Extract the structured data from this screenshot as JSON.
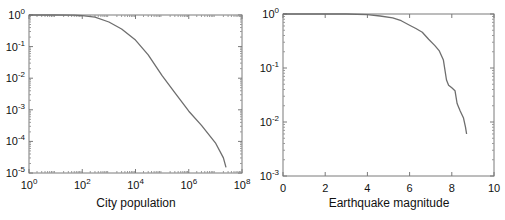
{
  "chart_data": [
    {
      "type": "line",
      "title": "",
      "xlabel": "City population",
      "ylabel": "",
      "xscale": "log",
      "yscale": "log",
      "xlim": [
        1,
        100000000
      ],
      "ylim": [
        1e-05,
        1
      ],
      "xticks": [
        "10^0",
        "10^2",
        "10^4",
        "10^6",
        "10^8"
      ],
      "yticks": [
        "10^0",
        "10^-1",
        "10^-2",
        "10^-3",
        "10^-4",
        "10^-5"
      ],
      "grid": false,
      "legend": null,
      "line_color": "#6e6e6e",
      "x": [
        1,
        10,
        50,
        100,
        300,
        1000,
        3000,
        10000,
        30000,
        100000,
        300000,
        1000000,
        3000000,
        10000000,
        20000000,
        25000000
      ],
      "y": [
        1.0,
        1.0,
        0.99,
        0.96,
        0.85,
        0.6,
        0.36,
        0.16,
        0.055,
        0.012,
        0.0035,
        0.0009,
        0.00032,
        9e-05,
        3e-05,
        1.5e-05
      ]
    },
    {
      "type": "line",
      "title": "",
      "xlabel": "Earthquake magnitude",
      "ylabel": "",
      "xscale": "linear",
      "yscale": "log",
      "xlim": [
        0,
        10
      ],
      "ylim": [
        0.001,
        1
      ],
      "xticks": [
        "0",
        "2",
        "4",
        "6",
        "8",
        "10"
      ],
      "yticks": [
        "10^0",
        "10^-1",
        "10^-2",
        "10^-3"
      ],
      "grid": false,
      "legend": null,
      "line_color": "#6e6e6e",
      "x": [
        0,
        3.0,
        4.0,
        4.6,
        5.2,
        5.6,
        6.0,
        6.3,
        6.6,
        6.9,
        7.2,
        7.4,
        7.6,
        7.75,
        7.85,
        8.0,
        8.15,
        8.25,
        8.4,
        8.55,
        8.65,
        8.7
      ],
      "y": [
        1.0,
        1.0,
        0.97,
        0.92,
        0.85,
        0.75,
        0.62,
        0.54,
        0.46,
        0.34,
        0.26,
        0.21,
        0.14,
        0.06,
        0.048,
        0.043,
        0.038,
        0.022,
        0.016,
        0.012,
        0.008,
        0.006
      ]
    }
  ],
  "panels": {
    "left": {
      "xlabel": "City population"
    },
    "right": {
      "xlabel": "Earthquake magnitude"
    }
  }
}
